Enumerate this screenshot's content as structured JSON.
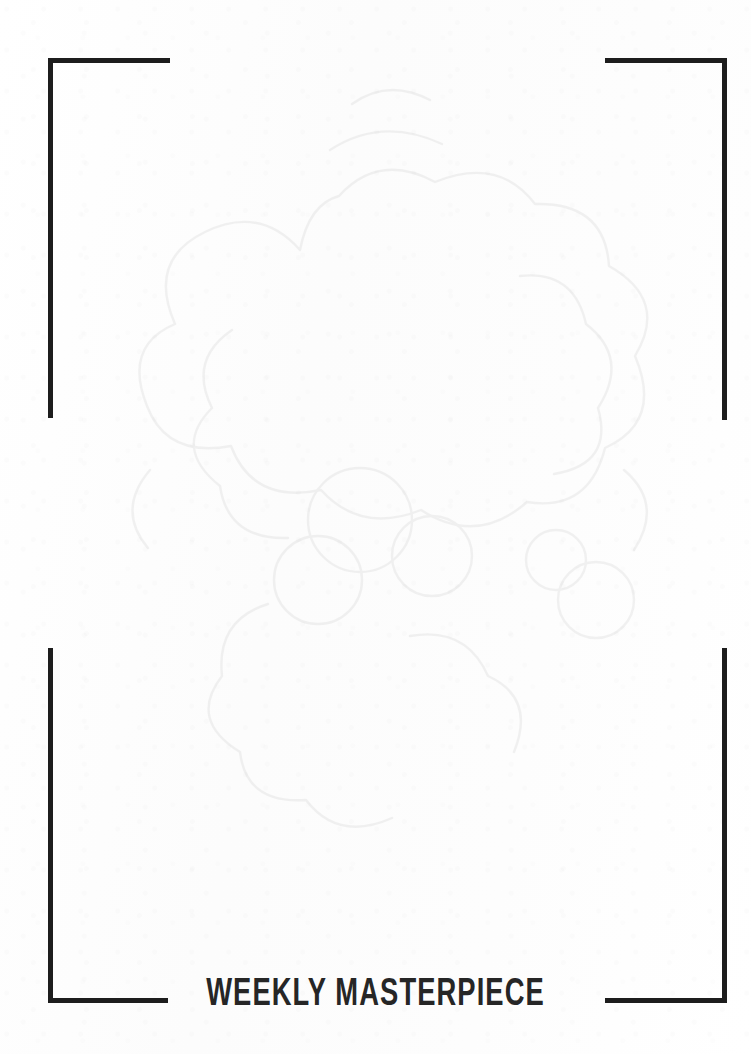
{
  "page": {
    "kind": "printed-worksheet-page",
    "paper_color": "#fdfdfd",
    "ink_color": "#1d1d1d",
    "title_color": "#262626"
  },
  "frame": {
    "corners": [
      {
        "name": "top-left",
        "label": ""
      },
      {
        "name": "top-right",
        "label": ""
      },
      {
        "name": "bottom-left",
        "label": ""
      },
      {
        "name": "bottom-right",
        "label": ""
      }
    ]
  },
  "footer": {
    "title": "WEEKLY MASTERPIECE"
  },
  "bleed_through": {
    "description": "faint reverse-side show-through",
    "upper_text": "",
    "lower_text": ""
  },
  "drawing_area": {
    "placeholder": ""
  }
}
